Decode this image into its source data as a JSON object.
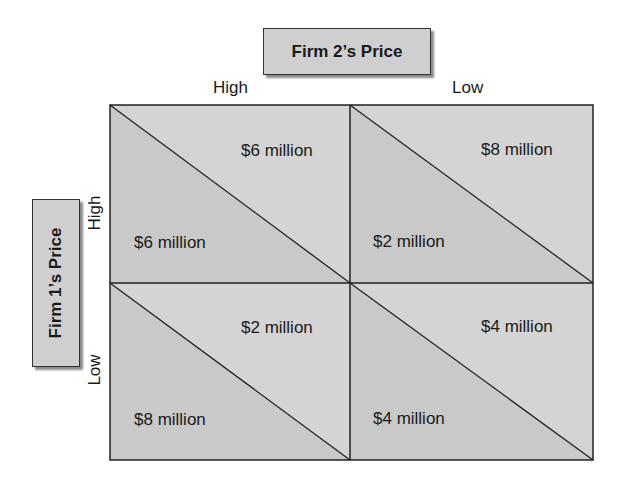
{
  "diagram": {
    "type": "payoff-matrix",
    "column_player": {
      "title": "Firm 2’s Price",
      "strategies": [
        "High",
        "Low"
      ]
    },
    "row_player": {
      "title": "Firm 1’s Price",
      "strategies": [
        "High",
        "Low"
      ]
    },
    "cells": [
      {
        "row": "High",
        "col": "High",
        "firm1_payoff": "$6 million",
        "firm2_payoff": "$6 million"
      },
      {
        "row": "High",
        "col": "Low",
        "firm1_payoff": "$2 million",
        "firm2_payoff": "$8 million"
      },
      {
        "row": "Low",
        "col": "High",
        "firm1_payoff": "$8 million",
        "firm2_payoff": "$2 million"
      },
      {
        "row": "Low",
        "col": "Low",
        "firm1_payoff": "$4 million",
        "firm2_payoff": "$4 million"
      }
    ],
    "colors": {
      "cell_fill": "#d3d3d3",
      "lower_triangle_fill": "#c8c8c8",
      "line": "#222222",
      "box_fill": "#cfcfcf"
    }
  }
}
